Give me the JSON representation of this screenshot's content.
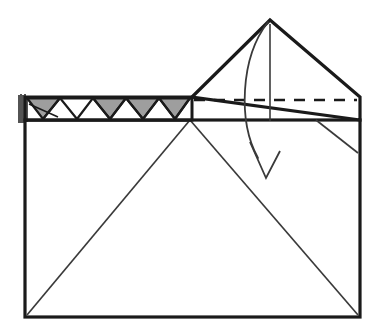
{
  "figure": {
    "background_color": "#ffffff",
    "ink_color": "#1a1a1a",
    "shaded_color": "#9e9e9e",
    "thin_line_color": "#3a3a3a"
  },
  "geometry": {
    "canvas": {
      "width": 372,
      "height": 331
    },
    "main_sheet": {
      "name": "paper-rectangle",
      "left": 25,
      "top": 120,
      "right": 360,
      "bottom": 317,
      "stroke_width": 3.2
    },
    "zigzag_band": {
      "name": "pleated-band",
      "left": 25,
      "right": 192,
      "top": 97,
      "bottom": 120,
      "stroke_width": 3.0,
      "teeth": 5,
      "fill_shaded": "#9e9e9e",
      "fill_open": "#ffffff"
    },
    "fringe": {
      "name": "paper-edge-fringe",
      "x": 20,
      "top": 95,
      "bottom": 123,
      "strokes": 5
    },
    "triangle_flap": {
      "name": "folded-triangle-flap",
      "apex": {
        "x": 270,
        "y": 20
      },
      "left_vertex": {
        "x": 192,
        "y": 97
      },
      "right_vertex": {
        "x": 360,
        "y": 97
      },
      "right_drop": {
        "x": 360,
        "y": 120
      },
      "stroke_width": 3.2
    },
    "fold_line_dashed": {
      "name": "valley-fold-crease",
      "x1": 194,
      "y1": 100,
      "x2": 357,
      "y2": 100,
      "dash": "11 9",
      "stroke_width": 2.4
    },
    "crease_diagonals": [
      {
        "name": "crease-diagonal-left",
        "x1": 190,
        "y1": 120,
        "x2": 27,
        "y2": 315,
        "stroke_width": 1.7
      },
      {
        "name": "crease-diagonal-right",
        "x1": 190,
        "y1": 120,
        "x2": 358,
        "y2": 315,
        "stroke_width": 1.7
      },
      {
        "name": "crease-corner-short",
        "x1": 316,
        "y1": 120,
        "x2": 358,
        "y2": 153,
        "stroke_width": 1.7
      }
    ],
    "apex_guide_line": {
      "name": "apex-vertical-guide",
      "x1": 270,
      "y1": 24,
      "x2": 270,
      "y2": 121,
      "stroke_width": 1.6
    },
    "motion_arrow": {
      "name": "fold-direction-arrow",
      "path": "M 268 22 C 240 58, 238 122, 258 158",
      "head": "M 250 142 L 266 178 L 280 151",
      "stroke_width": 1.8
    }
  }
}
